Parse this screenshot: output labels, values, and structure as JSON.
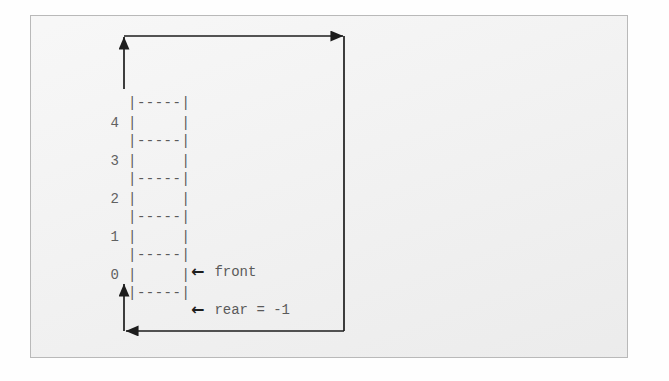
{
  "figure": {
    "type": "circular-queue-ascii-diagram",
    "queue": {
      "size": 5,
      "separator_art": "|-----|",
      "cell_art": "|     |",
      "indices": [
        "4",
        "3",
        "2",
        "1",
        "0"
      ],
      "cells": [
        {
          "index": "4",
          "value": ""
        },
        {
          "index": "3",
          "value": ""
        },
        {
          "index": "2",
          "value": ""
        },
        {
          "index": "1",
          "value": ""
        },
        {
          "index": "0",
          "value": ""
        }
      ]
    },
    "pointers": [
      {
        "id": "front",
        "arrow": "←",
        "label": "front"
      },
      {
        "id": "rear",
        "arrow": "←",
        "label": "rear = -1"
      }
    ],
    "wrap_arrows": {
      "top": {
        "from": "right-side",
        "to": "queue-top",
        "heads": [
          "up-left",
          "right"
        ]
      },
      "bottom": {
        "from": "right-side",
        "to": "queue-bottom",
        "heads": [
          "left",
          "up"
        ]
      }
    },
    "colors": {
      "panel_background": "#eeeeee",
      "panel_border": "#b9b9b9",
      "page_background": "#fefefe",
      "art_text": "#5a5a5a",
      "index_text": "#616161",
      "arrow_stroke": "#1d1d1d"
    }
  }
}
